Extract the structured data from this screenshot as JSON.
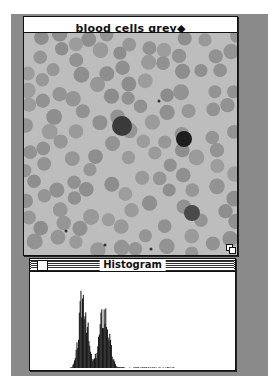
{
  "image_window": {
    "title": "blood cells grey◆",
    "content": "grayscale micrograph of blood cells",
    "grow_box_icon": "resize-grow-icon"
  },
  "histogram_window": {
    "title": "Histogram",
    "close_box_icon": "close-box-icon"
  },
  "chart_data": {
    "type": "bar",
    "title": "Histogram",
    "xlabel": "",
    "ylabel": "",
    "xlim": [
      0,
      255
    ],
    "peaks": [
      {
        "bin": 66,
        "relative_height": 1.0
      },
      {
        "bin": 92,
        "relative_height": 0.77
      }
    ],
    "grid": false
  }
}
